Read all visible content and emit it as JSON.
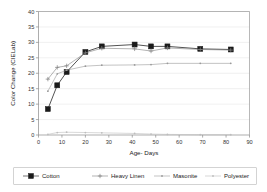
{
  "chart_data": {
    "type": "line",
    "title": "",
    "xlabel": "Age- Days",
    "ylabel": "Color Change (CIELab)",
    "xlim": [
      0,
      90
    ],
    "ylim": [
      0,
      40
    ],
    "xticks": [
      0,
      10,
      20,
      30,
      40,
      50,
      60,
      70,
      80,
      90
    ],
    "yticks": [
      0,
      5,
      10,
      15,
      20,
      25,
      30,
      35,
      40
    ],
    "grid": true,
    "legend_position": "bottom",
    "series": [
      {
        "name": "Cotton",
        "marker": "filled-square",
        "color": "#1a1a1a",
        "x": [
          4,
          8,
          12,
          20,
          27,
          41,
          48,
          55,
          69,
          82
        ],
        "y": [
          8.4,
          16.1,
          20.4,
          26.9,
          28.7,
          29.3,
          28.7,
          28.7,
          27.9,
          27.7
        ]
      },
      {
        "name": "Heavy Linen",
        "marker": "plus",
        "color": "#808080",
        "x": [
          4,
          8,
          12,
          20,
          27,
          41,
          48,
          55,
          69,
          82
        ],
        "y": [
          18.1,
          21.9,
          22.4,
          26.6,
          28.1,
          27.9,
          27.2,
          28.2,
          27.7,
          27.5
        ]
      },
      {
        "name": "Masonite",
        "marker": "dot",
        "color": "#9a9a9a",
        "x": [
          4,
          8,
          12,
          20,
          27,
          41,
          48,
          55,
          69,
          82
        ],
        "y": [
          14.2,
          19.8,
          21.0,
          22.3,
          22.6,
          22.7,
          22.8,
          23.2,
          23.2,
          23.2
        ]
      },
      {
        "name": "Polyester",
        "marker": "dot",
        "color": "#bdbdbd",
        "x": [
          4,
          8,
          12,
          20,
          27,
          41,
          48,
          55,
          69,
          82
        ],
        "y": [
          0.2,
          0.8,
          0.9,
          0.8,
          0.7,
          0.5,
          0.3,
          0.2,
          0.1,
          0.1
        ]
      }
    ]
  },
  "axes": {
    "xlabel": "Age- Days",
    "ylabel": "Color Change (CIELab)"
  },
  "legend": {
    "entries": [
      {
        "label": "Cotton"
      },
      {
        "label": "Heavy Linen"
      },
      {
        "label": "Masonite"
      },
      {
        "label": "Polyester"
      }
    ]
  },
  "ticks": {
    "x": [
      "0",
      "10",
      "20",
      "30",
      "40",
      "50",
      "60",
      "70",
      "80",
      "90"
    ],
    "y": [
      "0",
      "5",
      "10",
      "15",
      "20",
      "25",
      "30",
      "35",
      "40"
    ]
  }
}
